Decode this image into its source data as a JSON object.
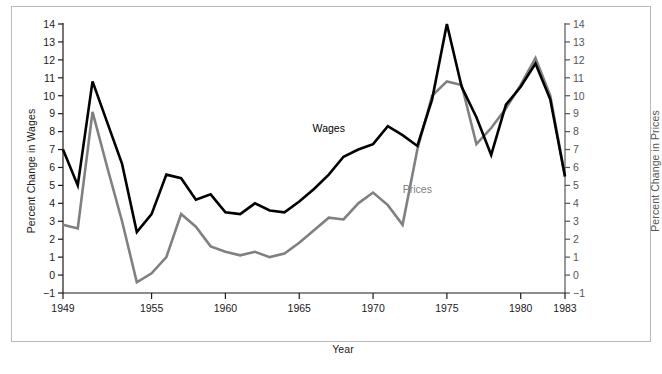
{
  "chart_data": {
    "type": "line",
    "title": "",
    "xlabel": "Year",
    "ylabel": "Percent Change in Wages",
    "ylabel_right": "Percent Change in Prices",
    "xlim": [
      1949,
      1983
    ],
    "ylim": [
      -1,
      14
    ],
    "grid": false,
    "legend": "inline-annotations",
    "xticks": [
      1949,
      1955,
      1960,
      1965,
      1970,
      1975,
      1980,
      1983
    ],
    "xtick_labels": [
      "1949",
      "1955",
      "1960",
      "1965",
      "1970",
      "1975",
      "1980",
      "1983"
    ],
    "yticks": [
      -1,
      0,
      1,
      2,
      3,
      4,
      5,
      6,
      7,
      8,
      9,
      10,
      11,
      12,
      13,
      14
    ],
    "ytick_labels": [
      "−1",
      "0",
      "1",
      "2",
      "3",
      "4",
      "5",
      "6",
      "7",
      "8",
      "9",
      "10",
      "11",
      "12",
      "13",
      "14"
    ],
    "yticks_right": [
      -1,
      0,
      1,
      2,
      3,
      4,
      5,
      6,
      7,
      8,
      9,
      10,
      11,
      12,
      13,
      14
    ],
    "ytick_labels_right": [
      "−1",
      "0",
      "1",
      "2",
      "3",
      "4",
      "5",
      "6",
      "7",
      "8",
      "9",
      "10",
      "11",
      "12",
      "13",
      "14"
    ],
    "x": [
      1949,
      1950,
      1951,
      1952,
      1953,
      1954,
      1955,
      1956,
      1957,
      1958,
      1959,
      1960,
      1961,
      1962,
      1963,
      1964,
      1965,
      1966,
      1967,
      1968,
      1969,
      1970,
      1971,
      1972,
      1973,
      1974,
      1975,
      1976,
      1977,
      1978,
      1979,
      1980,
      1981,
      1982,
      1983
    ],
    "series": [
      {
        "name": "Wages",
        "color": "#000000",
        "values": [
          7.0,
          5.0,
          10.8,
          8.5,
          6.2,
          2.4,
          3.4,
          5.6,
          5.4,
          4.2,
          4.5,
          3.5,
          3.4,
          4.0,
          3.6,
          3.5,
          4.1,
          4.8,
          5.6,
          6.6,
          7.0,
          7.3,
          8.3,
          7.8,
          7.2,
          9.8,
          14.0,
          10.5,
          8.8,
          6.7,
          9.5,
          10.5,
          11.8,
          9.8,
          5.5
        ]
      },
      {
        "name": "Prices",
        "color": "#808080",
        "values": [
          2.8,
          2.6,
          9.1,
          6.0,
          3.0,
          -0.4,
          0.1,
          1.0,
          3.4,
          2.7,
          1.6,
          1.3,
          1.1,
          1.3,
          1.0,
          1.2,
          1.8,
          2.5,
          3.2,
          3.1,
          4.0,
          4.6,
          3.9,
          2.8,
          7.0,
          10.0,
          10.8,
          10.6,
          7.3,
          8.2,
          9.3,
          10.6,
          12.1,
          10.0,
          5.5
        ]
      }
    ],
    "annotations": [
      {
        "text": "Wages",
        "x": 1967,
        "y": 8.0,
        "color": "#000000"
      },
      {
        "text": "Prices",
        "x": 1973,
        "y": 4.6,
        "color": "#808080"
      }
    ]
  },
  "figure": {
    "frame_color": "#b9b9b9",
    "background": "#ffffff",
    "caption_fragment": ""
  }
}
